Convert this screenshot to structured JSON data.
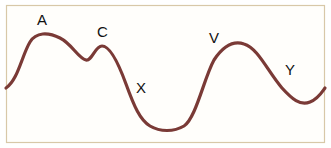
{
  "diagram": {
    "frame_color": "#d8c8a8",
    "curve_color": "#7a3a36",
    "labels": [
      {
        "id": "A",
        "text": "A",
        "x": 37,
        "y": 25
      },
      {
        "id": "C",
        "text": "C",
        "x": 97,
        "y": 37
      },
      {
        "id": "X",
        "text": "X",
        "x": 136,
        "y": 93
      },
      {
        "id": "V",
        "text": "V",
        "x": 209,
        "y": 43
      },
      {
        "id": "Y",
        "text": "Y",
        "x": 285,
        "y": 75
      }
    ]
  }
}
